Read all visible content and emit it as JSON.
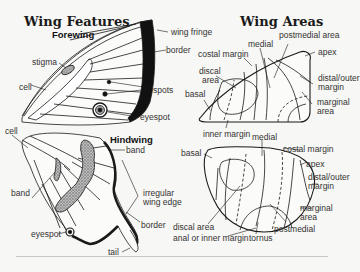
{
  "wing_features": {
    "title": "Wing Features",
    "forewing": {
      "title": "Forewing",
      "labels": {
        "wing_fringe": "wing fringe",
        "border": "border",
        "stigma": "stigma",
        "cell": "cell",
        "spots": "spots",
        "eyespot": "eyespot"
      }
    },
    "hindwing": {
      "title": "Hindwing",
      "labels": {
        "cell": "cell",
        "band_right": "band",
        "band_left": "band",
        "irregular_line1": "irregular",
        "irregular_line2": "wing edge",
        "border": "border",
        "eyespot": "eyespot",
        "tail": "tail"
      }
    }
  },
  "wing_areas": {
    "title": "Wing Areas",
    "forewing": {
      "labels": {
        "postmedial_area": "postmedial area",
        "medial": "medial",
        "costal_margin": "costal margin",
        "apex": "apex",
        "discal_line1": "discal",
        "discal_line2": "area",
        "basal": "basal",
        "distal_line1": "distal/outer",
        "distal_line2": "margin",
        "marginal_line1": "marginal",
        "marginal_line2": "area",
        "inner_margin": "inner margin"
      }
    },
    "hindwing": {
      "labels": {
        "medial": "medial",
        "basal": "basal",
        "costal_margin": "costal margin",
        "apex": "apex",
        "distal_line1": "distal/outer",
        "distal_line2": "margin",
        "marginal_line1": "marginal",
        "marginal_line2": "area",
        "discal_area": "discal area",
        "postmedial": "postmedial",
        "anal_inner_margin": "anal or inner margin",
        "tornus": "tornus"
      }
    }
  },
  "colors": {
    "background": "#f7f7f5",
    "ink": "#1a1a1a",
    "label": "#333333"
  }
}
